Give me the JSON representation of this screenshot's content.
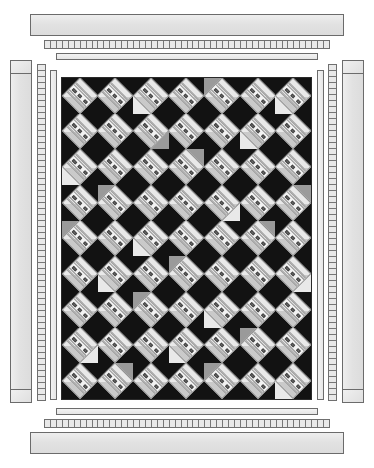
{
  "document": {
    "title": "Quilt Layout Diagram",
    "background_color": "#ffffff"
  },
  "palette": {
    "dark_fabric": "#121212",
    "medium_dark_fabric": "#3a3a3a",
    "medium_fabric": "#9a9a9a",
    "light_fabric": "#e9e9e9",
    "bar_fabric": "#f2f2f2",
    "pip_fabric": "#6e6e6e",
    "border_fabric": "#e3e3e3",
    "outline": "#6b6b6b"
  },
  "quilt_field": {
    "name": "quilt-center",
    "columns": 7,
    "rows": 9,
    "block_name": "square-in-a-square-with-striped-bar",
    "pips_per_bar": 3,
    "bounds": {
      "x": 61,
      "y": 77,
      "width": 251,
      "height": 323
    },
    "block_corner_shades": [
      [
        "dark",
        "dark",
        "light",
        "dark",
        "medium",
        "dark",
        "light"
      ],
      [
        "dark",
        "dark",
        "medium",
        "dark",
        "dark",
        "light",
        "dark"
      ],
      [
        "light",
        "dark",
        "dark",
        "medium",
        "dark",
        "dark",
        "dark"
      ],
      [
        "dark",
        "medium",
        "dark",
        "dark",
        "light",
        "dark",
        "medium"
      ],
      [
        "medium",
        "dark",
        "light",
        "dark",
        "dark",
        "medium",
        "dark"
      ],
      [
        "dark",
        "light",
        "dark",
        "medium",
        "dark",
        "dark",
        "light"
      ],
      [
        "dark",
        "dark",
        "medium",
        "dark",
        "light",
        "dark",
        "dark"
      ],
      [
        "light",
        "dark",
        "dark",
        "light",
        "dark",
        "medium",
        "dark"
      ],
      [
        "dark",
        "medium",
        "dark",
        "dark",
        "medium",
        "dark",
        "light"
      ]
    ]
  },
  "borders": {
    "top": [
      {
        "name": "outer-border-top",
        "kind": "plain",
        "x": 30,
        "y": 14,
        "width": 314,
        "height": 22
      },
      {
        "name": "pieced-border-top",
        "kind": "ticked",
        "x": 44,
        "y": 40,
        "width": 286,
        "height": 9,
        "segments": 48
      },
      {
        "name": "inner-border-top",
        "kind": "thin",
        "x": 56,
        "y": 53,
        "width": 262,
        "height": 7
      }
    ],
    "bottom": [
      {
        "name": "inner-border-bottom",
        "kind": "thin",
        "x": 56,
        "y": 408,
        "width": 262,
        "height": 7
      },
      {
        "name": "pieced-border-bottom",
        "kind": "ticked",
        "x": 44,
        "y": 419,
        "width": 286,
        "height": 9,
        "segments": 48
      },
      {
        "name": "outer-border-bottom",
        "kind": "plain",
        "x": 30,
        "y": 432,
        "width": 314,
        "height": 22
      }
    ],
    "left": [
      {
        "name": "outer-border-left",
        "kind": "plain",
        "x": 10,
        "y": 60,
        "width": 22,
        "height": 343
      },
      {
        "name": "pieced-border-left",
        "kind": "ticked",
        "x": 37,
        "y": 64,
        "width": 9,
        "height": 337,
        "segments": 56
      },
      {
        "name": "inner-border-left",
        "kind": "thin",
        "x": 50,
        "y": 70,
        "width": 7,
        "height": 330
      }
    ],
    "right": [
      {
        "name": "inner-border-right",
        "kind": "thin",
        "x": 317,
        "y": 70,
        "width": 7,
        "height": 330
      },
      {
        "name": "pieced-border-right",
        "kind": "ticked",
        "x": 328,
        "y": 64,
        "width": 9,
        "height": 337,
        "segments": 56
      },
      {
        "name": "outer-border-right",
        "kind": "plain",
        "x": 342,
        "y": 60,
        "width": 22,
        "height": 343
      }
    ]
  },
  "corners": [
    {
      "name": "corner-square-top-left",
      "x": 10,
      "y": 60,
      "width": 22,
      "height": 14
    },
    {
      "name": "corner-square-top-right",
      "x": 342,
      "y": 60,
      "width": 22,
      "height": 14
    },
    {
      "name": "corner-square-bottom-left",
      "x": 10,
      "y": 389,
      "width": 22,
      "height": 14
    },
    {
      "name": "corner-square-bottom-right",
      "x": 342,
      "y": 389,
      "width": 22,
      "height": 14
    }
  ]
}
